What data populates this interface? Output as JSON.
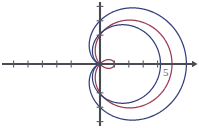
{
  "figure": {
    "title": "",
    "background_color": "#ffffff",
    "width": 199,
    "height": 128
  },
  "axes": {
    "x_axis_name": "x-axis",
    "y_axis_name": "y-axis",
    "axis_color": "#4a4a52",
    "tick_color": "#5a5a62",
    "x_axis_y_px": 64,
    "y_axis_x_px": 100,
    "has_right_arrow": true,
    "has_top_arrow": false,
    "unit_px": 14.4,
    "x_ticks": [
      -6,
      -5,
      -4,
      -3,
      -2,
      1,
      2,
      3,
      4
    ],
    "y_ticks": [
      -4,
      -3,
      -2,
      2,
      3,
      4
    ],
    "labels": [
      {
        "text": "5",
        "x_px": 163,
        "y_px": 76,
        "color": "#6b6b52"
      }
    ]
  },
  "chart_data": {
    "type": "line",
    "title": "",
    "xlabel": "",
    "ylabel": "",
    "grid": false,
    "legend": "none",
    "coordinate_system": "polar",
    "xlim": [
      -6.9,
      6.9
    ],
    "ylim": [
      -4.4,
      4.4
    ],
    "series": [
      {
        "name": "limacon-red",
        "color": "#9c3a52",
        "equation": "r = 2 + 3 cos(theta)",
        "polar_a": 2,
        "polar_b": 3,
        "samples": 720,
        "description": "maroon limacon with inner loop, bulging left of the y-axis, rightmost extent near x = 5"
      },
      {
        "name": "cardioid-blue-outer",
        "color": "#333f7a",
        "equation": "r = 3 + 3 cos(theta)",
        "polar_a": 3,
        "polar_b": 3,
        "samples": 720,
        "description": "navy cardioid passing through origin, rightmost extent near x = 6"
      },
      {
        "name": "cardioid-blue-inner",
        "color": "#333f7a",
        "equation": "r = 2.1 + 2.1 cos(theta)",
        "polar_a": 2.1,
        "polar_b": 2.1,
        "samples": 720,
        "description": "smaller navy cardioid nested inside, rightmost extent near x = 4.2"
      }
    ]
  }
}
